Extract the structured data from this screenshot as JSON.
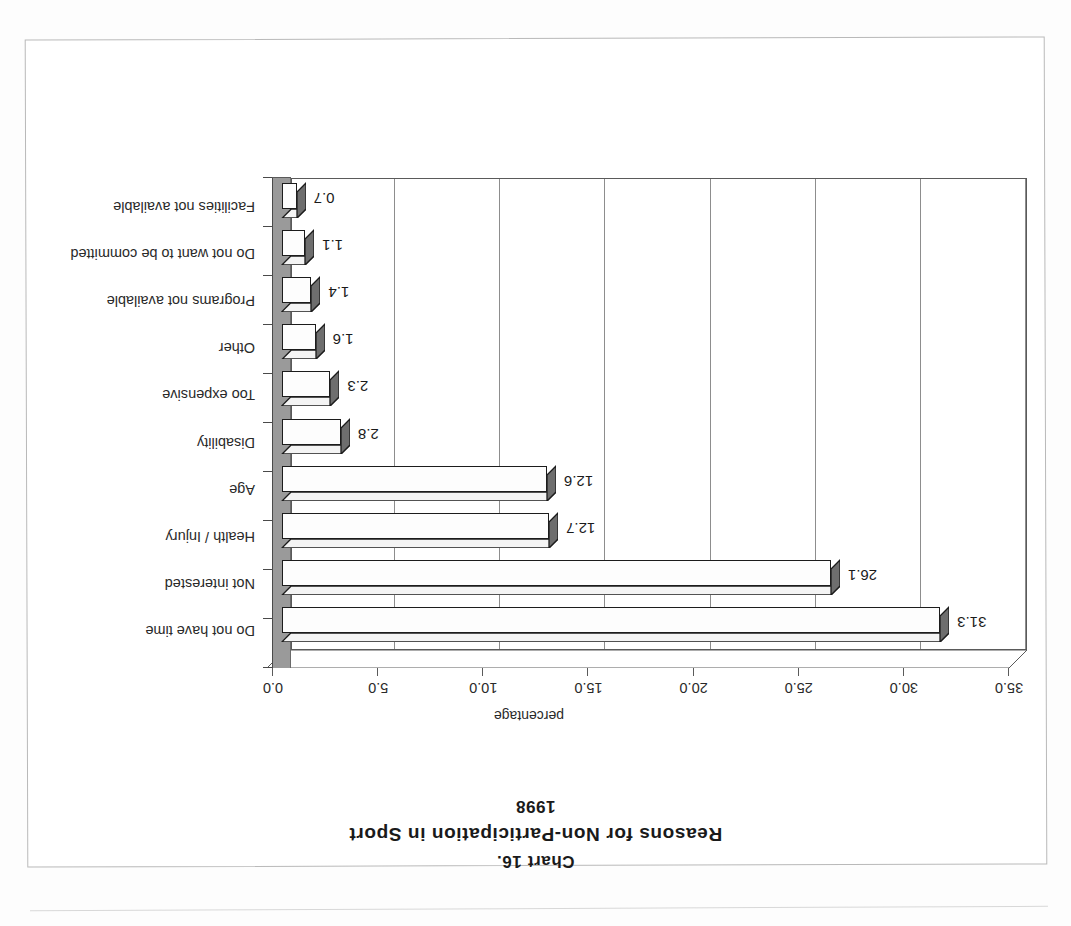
{
  "document": {
    "chart_number": "Chart 16.",
    "chart_title": "Reasons for Non-Participation in Sport",
    "chart_year": "1998"
  },
  "chart_data": {
    "type": "bar",
    "orientation": "horizontal",
    "title": "Reasons for Non-Participation in Sport",
    "subtitle": "1998",
    "label": "Chart 16.",
    "xlabel": "percentage",
    "ylabel": "",
    "xlim": [
      0.0,
      35.0
    ],
    "xticks": [
      "0.0",
      "5.0",
      "10.0",
      "15.0",
      "20.0",
      "25.0",
      "30.0",
      "35.0"
    ],
    "grid": true,
    "legend": "none",
    "style": "3d-bar",
    "categories": [
      "Do not have time",
      "Not interested",
      "Health / Injury",
      "Age",
      "Disability",
      "Too expensive",
      "Other",
      "Programs not available",
      "Do not want to be committed",
      "Facilities not available"
    ],
    "values": [
      31.3,
      26.1,
      12.7,
      12.6,
      2.8,
      2.3,
      1.6,
      1.4,
      1.1,
      0.7
    ],
    "value_labels": [
      "31.3",
      "26.1",
      "12.7",
      "12.6",
      "2.8",
      "2.3",
      "1.6",
      "1.4",
      "1.1",
      "0.7"
    ]
  },
  "colors": {
    "bar_face": "#fdfdfd",
    "bar_outline": "#1c1c1c",
    "bar_shade": "#6e6e6e",
    "side_wall": "#9a9a9a",
    "grid": "#8d8d8d",
    "text": "#1a1a1a",
    "page_border": "#b9b9b9"
  },
  "page": {
    "rotation": "180deg"
  }
}
